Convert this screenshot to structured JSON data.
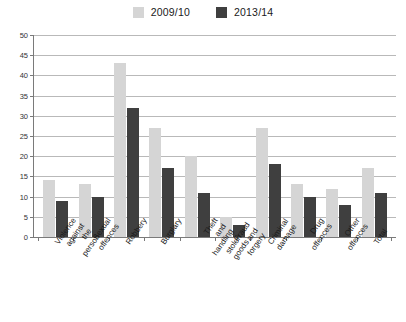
{
  "chart_data": {
    "type": "bar",
    "title": "",
    "subtitle": "",
    "xlabel": "",
    "ylabel": "",
    "ylim": [
      0,
      50
    ],
    "yticks": [
      0,
      5,
      10,
      15,
      20,
      25,
      30,
      35,
      40,
      45,
      50
    ],
    "grid": true,
    "legend_position": "top-center",
    "categories": [
      "Violence against the person",
      "Sexual offences",
      "Robbery",
      "Burglary",
      "Theft and handling stolen goods",
      "Fraud and forgery",
      "Criminal damage",
      "Drug offences",
      "Other offences",
      "Total"
    ],
    "series": [
      {
        "name": "2009/10",
        "color": "#d5d5d5",
        "values": [
          14,
          13,
          43,
          27,
          20,
          5,
          27,
          13,
          12,
          17
        ]
      },
      {
        "name": "2013/14",
        "color": "#3f3f3f",
        "values": [
          9,
          10,
          32,
          17,
          11,
          3,
          18,
          10,
          8,
          11
        ]
      }
    ]
  },
  "legend": {
    "entries": [
      {
        "label": "2009/10",
        "color": "#d5d5d5"
      },
      {
        "label": "2013/14",
        "color": "#3f3f3f"
      }
    ]
  }
}
